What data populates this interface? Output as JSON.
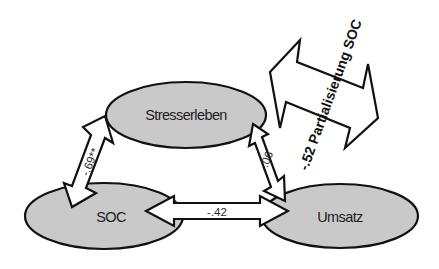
{
  "diagram": {
    "type": "path-model",
    "nodes": [
      {
        "id": "stresserleben",
        "label": "Stresserleben",
        "cx": 186,
        "cy": 115,
        "rx": 80,
        "ry": 33
      },
      {
        "id": "soc",
        "label": "SOC",
        "cx": 104,
        "cy": 216,
        "rx": 79,
        "ry": 33
      },
      {
        "id": "umsatz",
        "label": "Umsatz",
        "cx": 340,
        "cy": 216,
        "rx": 78,
        "ry": 32
      }
    ],
    "edges": [
      {
        "from": "soc",
        "to": "stresserleben",
        "label": "-.69**",
        "bidirectional": true
      },
      {
        "from": "stresserleben",
        "to": "umsatz",
        "label": "-.06",
        "bidirectional": true
      },
      {
        "from": "soc",
        "to": "umsatz",
        "label": "-.42",
        "bidirectional": true
      }
    ],
    "annotation": {
      "label": "-.52 Partialisierung SOC",
      "shape": "large-double-arrow",
      "rotation_deg": -70
    },
    "colors": {
      "node_fill": "#c9c9c9",
      "stroke": "#111111",
      "arrow_fill": "#ffffff"
    }
  }
}
